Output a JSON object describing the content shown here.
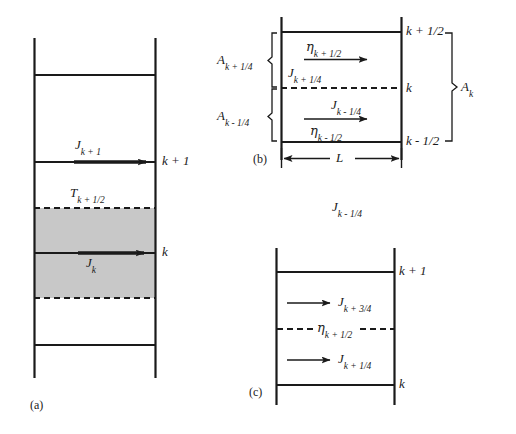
{
  "figure": {
    "type": "diagram",
    "background_color": "#ffffff",
    "line_color": "#1a1a1a",
    "shaded_fill_color": "#c8c8c8"
  },
  "panels": [
    {
      "id": "a",
      "tag": "(a)",
      "shaded_region": true,
      "grid_lines": [
        {
          "style": "solid",
          "label": ""
        },
        {
          "style": "solid",
          "label": "k + 1"
        },
        {
          "style": "dashed",
          "label": ""
        },
        {
          "style": "solid",
          "label": "k"
        },
        {
          "style": "dashed",
          "label": ""
        },
        {
          "style": "solid",
          "label": ""
        }
      ],
      "labels": [
        {
          "name": "flux-j-k-plus-1",
          "base": "J",
          "sub": "k + 1"
        },
        {
          "name": "temperature-t-k-plus-half",
          "base": "T",
          "sub": "k + 1/2"
        },
        {
          "name": "flux-j-k",
          "base": "J",
          "sub": "k"
        },
        {
          "name": "level-k-plus-1",
          "base": "k + 1",
          "sub": ""
        },
        {
          "name": "level-k",
          "base": "k",
          "sub": ""
        }
      ]
    },
    {
      "id": "b",
      "tag": "(b)",
      "width_label": {
        "base": "L",
        "sub": ""
      },
      "right_labels": [
        {
          "name": "level-k-plus-half",
          "base": "k + 1/2",
          "sub": ""
        },
        {
          "name": "level-k",
          "base": "k",
          "sub": ""
        },
        {
          "name": "level-k-minus-half",
          "base": "k - 1/2",
          "sub": ""
        }
      ],
      "brace_label_right": {
        "base": "A",
        "sub": "k"
      },
      "left_labels": [
        {
          "name": "area-a-k-plus-quarter",
          "base": "A",
          "sub": "k + 1/4"
        },
        {
          "name": "area-a-k-minus-quarter",
          "base": "A",
          "sub": "k - 1/4"
        }
      ],
      "upper_cell": {
        "above_arrow": {
          "base": "η",
          "sub": "k + 1/2",
          "greek": true
        },
        "below_arrow": {
          "base": "J",
          "sub": "k + 1/4",
          "greek": false
        }
      },
      "lower_cell": {
        "above_arrow": {
          "base": "J",
          "sub": "k - 1/4",
          "greek": false
        },
        "below_arrow": {
          "base": "η",
          "sub": "k - 1/2",
          "greek": true
        }
      },
      "caption_below": {
        "base": "J",
        "sub": "k - 1/4"
      }
    },
    {
      "id": "c",
      "tag": "(c)",
      "right_labels": [
        {
          "name": "level-k-plus-1",
          "base": "k + 1",
          "sub": ""
        },
        {
          "name": "level-k",
          "base": "k",
          "sub": ""
        }
      ],
      "upper_arrow_label": {
        "base": "J",
        "sub": "k + 3/4"
      },
      "mid_dashed_label": {
        "base": "η",
        "sub": "k + 1/2",
        "greek": true
      },
      "lower_arrow_label": {
        "base": "J",
        "sub": "k + 1/4"
      }
    }
  ]
}
